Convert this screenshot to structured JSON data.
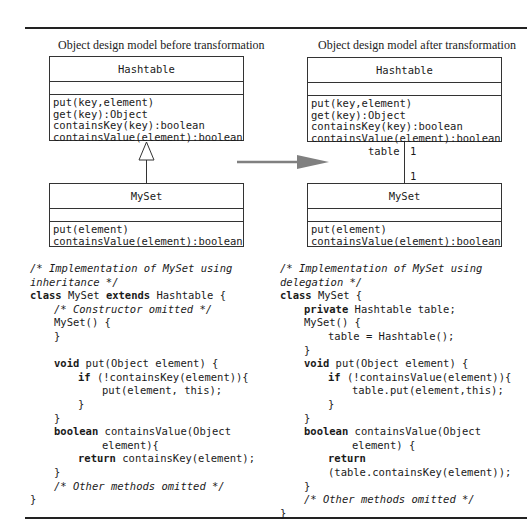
{
  "left": {
    "caption": "Object design model before transformation",
    "superclass": {
      "name": "Hashtable",
      "operations": [
        "put(key,element)",
        "get(key):Object",
        "containsKey(key):boolean",
        "containsValue(element):boolean"
      ]
    },
    "relationship": "inheritance",
    "subclass": {
      "name": "MySet",
      "operations": [
        "put(element)",
        "containsValue(element):boolean"
      ]
    },
    "code": [
      {
        "indent": 0,
        "parts": [
          {
            "t": "/* Implementation of MySet using",
            "s": "cm"
          }
        ]
      },
      {
        "indent": 0,
        "parts": [
          {
            "t": "inheritance */",
            "s": "cm"
          }
        ]
      },
      {
        "indent": 0,
        "parts": [
          {
            "t": "class",
            "s": "kw"
          },
          {
            "t": " MySet ",
            "s": ""
          },
          {
            "t": "extends",
            "s": "kw"
          },
          {
            "t": " Hashtable {",
            "s": ""
          }
        ]
      },
      {
        "indent": 1,
        "parts": [
          {
            "t": "/* Constructor omitted */",
            "s": "cm"
          }
        ]
      },
      {
        "indent": 1,
        "parts": [
          {
            "t": "MySet() {",
            "s": ""
          }
        ]
      },
      {
        "indent": 1,
        "parts": [
          {
            "t": "}",
            "s": ""
          }
        ]
      },
      {
        "indent": 0,
        "parts": [
          {
            "t": "",
            "s": ""
          }
        ]
      },
      {
        "indent": 1,
        "parts": [
          {
            "t": "void",
            "s": "kw"
          },
          {
            "t": " put(Object element) {",
            "s": ""
          }
        ]
      },
      {
        "indent": 2,
        "parts": [
          {
            "t": "if",
            "s": "kw"
          },
          {
            "t": " (!containsKey(element)){",
            "s": ""
          }
        ]
      },
      {
        "indent": 3,
        "parts": [
          {
            "t": "put(element, this);",
            "s": ""
          }
        ]
      },
      {
        "indent": 2,
        "parts": [
          {
            "t": "}",
            "s": ""
          }
        ]
      },
      {
        "indent": 1,
        "parts": [
          {
            "t": "}",
            "s": ""
          }
        ]
      },
      {
        "indent": 1,
        "parts": [
          {
            "t": "boolean",
            "s": "kw"
          },
          {
            "t": " containsValue(Object",
            "s": ""
          }
        ]
      },
      {
        "indent": 3,
        "parts": [
          {
            "t": "element){",
            "s": ""
          }
        ]
      },
      {
        "indent": 2,
        "parts": [
          {
            "t": "return",
            "s": "kw"
          },
          {
            "t": " containsKey(element);",
            "s": ""
          }
        ]
      },
      {
        "indent": 1,
        "parts": [
          {
            "t": "}",
            "s": ""
          }
        ]
      },
      {
        "indent": 1,
        "parts": [
          {
            "t": "/* Other methods omitted */",
            "s": "cm"
          }
        ]
      },
      {
        "indent": 0,
        "parts": [
          {
            "t": "}",
            "s": ""
          }
        ]
      }
    ]
  },
  "right": {
    "caption": "Object design model after transformation",
    "superclass": {
      "name": "Hashtable",
      "operations": [
        "put(key,element)",
        "get(key):Object",
        "containsKey(key):boolean",
        "containsValue(element):boolean"
      ]
    },
    "relationship": "association",
    "association": {
      "role": "table",
      "multiplicity_top": "1",
      "multiplicity_bottom": "1"
    },
    "subclass": {
      "name": "MySet",
      "operations": [
        "put(element)",
        "containsValue(element):boolean"
      ]
    },
    "code": [
      {
        "indent": 0,
        "parts": [
          {
            "t": "/* Implementation of MySet using",
            "s": "cm"
          }
        ]
      },
      {
        "indent": 0,
        "parts": [
          {
            "t": "delegation */",
            "s": "cm"
          }
        ]
      },
      {
        "indent": 0,
        "parts": [
          {
            "t": "class",
            "s": "kw"
          },
          {
            "t": " MySet {",
            "s": ""
          }
        ]
      },
      {
        "indent": 1,
        "parts": [
          {
            "t": "private",
            "s": "kw"
          },
          {
            "t": " Hashtable table;",
            "s": ""
          }
        ]
      },
      {
        "indent": 1,
        "parts": [
          {
            "t": "MySet() {",
            "s": ""
          }
        ]
      },
      {
        "indent": 2,
        "parts": [
          {
            "t": "table = Hashtable();",
            "s": ""
          }
        ]
      },
      {
        "indent": 1,
        "parts": [
          {
            "t": "}",
            "s": ""
          }
        ]
      },
      {
        "indent": 1,
        "parts": [
          {
            "t": "void",
            "s": "kw"
          },
          {
            "t": " put(Object element) {",
            "s": ""
          }
        ]
      },
      {
        "indent": 2,
        "parts": [
          {
            "t": "if",
            "s": "kw"
          },
          {
            "t": " (!containsValue(element)){",
            "s": ""
          }
        ]
      },
      {
        "indent": 3,
        "parts": [
          {
            "t": "table.put(element,this);",
            "s": ""
          }
        ]
      },
      {
        "indent": 2,
        "parts": [
          {
            "t": "}",
            "s": ""
          }
        ]
      },
      {
        "indent": 1,
        "parts": [
          {
            "t": "}",
            "s": ""
          }
        ]
      },
      {
        "indent": 1,
        "parts": [
          {
            "t": "boolean",
            "s": "kw"
          },
          {
            "t": " containsValue(Object",
            "s": ""
          }
        ]
      },
      {
        "indent": 3,
        "parts": [
          {
            "t": "element) {",
            "s": ""
          }
        ]
      },
      {
        "indent": 2,
        "parts": [
          {
            "t": "return",
            "s": "kw"
          }
        ]
      },
      {
        "indent": 2,
        "parts": [
          {
            "t": "(table.containsKey(element));",
            "s": ""
          }
        ]
      },
      {
        "indent": 1,
        "parts": [
          {
            "t": "}",
            "s": ""
          }
        ]
      },
      {
        "indent": 1,
        "parts": [
          {
            "t": "/* Other methods omitted */",
            "s": "cm"
          }
        ]
      },
      {
        "indent": 0,
        "parts": [
          {
            "t": "}",
            "s": ""
          }
        ]
      }
    ]
  },
  "transform_arrow": {
    "color": "#808080"
  }
}
